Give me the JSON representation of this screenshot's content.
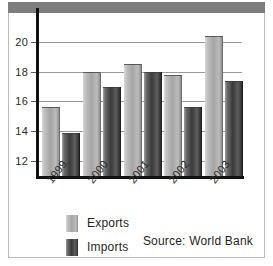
{
  "chart_data": {
    "type": "bar",
    "title": "",
    "xlabel": "",
    "ylabel": "",
    "categories": [
      "1999",
      "2000",
      "2001",
      "2002",
      "2003"
    ],
    "series": [
      {
        "name": "Exports",
        "values": [
          15.6,
          18.0,
          18.5,
          17.8,
          20.4
        ],
        "color": "#a5a5a5"
      },
      {
        "name": "Imports",
        "values": [
          13.9,
          17.0,
          18.0,
          15.6,
          17.4
        ],
        "color": "#3a3a3a"
      }
    ],
    "ylim": [
      11.0,
      21.2
    ],
    "yticks": [
      12,
      14,
      16,
      18,
      20
    ],
    "ytick_labels": [
      "12",
      "14",
      "16",
      "18",
      "20"
    ],
    "grid": true,
    "legend_position": "bottom-left",
    "annotations": [
      "Source: World Bank"
    ]
  },
  "legend": {
    "items": [
      {
        "label": "Exports"
      },
      {
        "label": "Imports"
      }
    ]
  },
  "footer": {
    "source": "Source: World Bank"
  },
  "colors": {
    "header_band": "#7d7d7d",
    "frame_border": "#bdbdbd",
    "axis": "#111111",
    "gridline": "#9a9a9a",
    "exports_bar": "#a5a5a5",
    "imports_bar": "#3a3a3a",
    "background": "#ffffff"
  }
}
